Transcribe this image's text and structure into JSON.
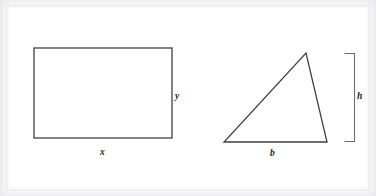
{
  "figure": {
    "background_color": "#ffffff",
    "stroke_color": "#3f3f48",
    "label_color": "#1d1d22",
    "canvas": {
      "width": 376,
      "height": 196
    }
  },
  "shapes": {
    "rectangle": {
      "name": "rectangle",
      "x": 34,
      "y": 48,
      "width": 138,
      "height": 90,
      "stroke_width": 1.3,
      "labels": {
        "width_label": "x",
        "height_label": "y"
      },
      "label_positions": {
        "width_label": {
          "x": 100,
          "y": 148
        },
        "height_label": {
          "x": 175,
          "y": 92
        }
      }
    },
    "triangle": {
      "name": "triangle",
      "points": [
        {
          "x": 224,
          "y": 142
        },
        {
          "x": 327,
          "y": 142
        },
        {
          "x": 306,
          "y": 53
        }
      ],
      "stroke_width": 1.3,
      "labels": {
        "base_label": "b"
      },
      "label_positions": {
        "base_label": {
          "x": 270,
          "y": 149
        }
      }
    },
    "height_bracket": {
      "name": "height-bracket",
      "top": 53,
      "bottom": 142,
      "left": 344,
      "right": 355,
      "stroke_width": 1.0,
      "labels": {
        "height_label": "h"
      },
      "label_positions": {
        "height_label": {
          "x": 357,
          "y": 92
        }
      }
    }
  }
}
